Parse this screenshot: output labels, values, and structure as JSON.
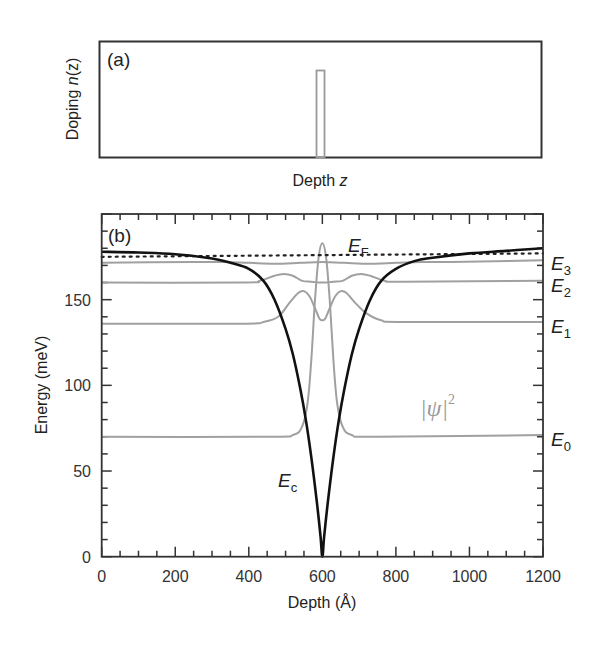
{
  "chart_data": [
    {
      "panel": "(a)",
      "type": "line",
      "title": "",
      "xlabel": "Depth z",
      "ylabel": "Doping n(z)",
      "grid": false,
      "description": "Delta-doping profile: narrow rectangular spike at center depth",
      "series": [
        {
          "name": "n(z)",
          "color": "#9a9a9a",
          "shape": "narrow rectangle at z = 600 Å (relative), width ≈ 25 Å"
        }
      ]
    },
    {
      "panel": "(b)",
      "type": "line",
      "title": "",
      "xlabel": "Depth (Å)",
      "ylabel": "Energy (meV)",
      "xlim": [
        0,
        1200
      ],
      "ylim": [
        0,
        200
      ],
      "xticks": [
        0,
        200,
        400,
        600,
        800,
        1000,
        1200
      ],
      "yticks": [
        0,
        50,
        100,
        150
      ],
      "grid": false,
      "annotations": [
        "(b)",
        "E_F",
        "E_c",
        "|ψ|^2",
        "E_0",
        "E_1",
        "E_2",
        "E_3"
      ],
      "series": [
        {
          "name": "E_c (conduction band edge)",
          "color": "#111111",
          "style": "solid",
          "x": [
            0,
            100,
            200,
            300,
            350,
            400,
            440,
            470,
            500,
            520,
            540,
            555,
            570,
            585,
            595,
            600,
            605,
            615,
            630,
            645,
            660,
            680,
            700,
            730,
            760,
            800,
            850,
            900,
            1000,
            1100,
            1200
          ],
          "y": [
            178,
            177.5,
            176.5,
            174,
            171.5,
            168,
            161,
            150,
            133,
            118,
            98,
            80,
            58,
            32,
            12,
            0,
            12,
            32,
            58,
            80,
            98,
            118,
            133,
            150,
            161,
            168,
            172.5,
            174.5,
            177,
            178.5,
            180
          ]
        },
        {
          "name": "E_F (Fermi level)",
          "color": "#222222",
          "style": "dotted",
          "x": [
            0,
            1200
          ],
          "y": [
            175,
            177
          ]
        },
        {
          "name": "E_0 + |ψ0|^2",
          "color": "#a0a0a0",
          "style": "solid",
          "x": [
            0,
            450,
            520,
            545,
            560,
            570,
            580,
            590,
            600,
            610,
            620,
            630,
            640,
            655,
            680,
            750,
            1200
          ],
          "y": [
            70,
            70,
            71,
            76,
            90,
            115,
            150,
            175,
            183,
            175,
            150,
            115,
            90,
            76,
            71,
            70,
            71
          ]
        },
        {
          "name": "E_1 + |ψ1|^2",
          "color": "#a0a0a0",
          "style": "solid",
          "x": [
            0,
            380,
            440,
            480,
            510,
            535,
            550,
            565,
            580,
            592,
            600,
            608,
            620,
            635,
            650,
            665,
            690,
            720,
            760,
            820,
            1200
          ],
          "y": [
            136,
            136,
            137,
            140,
            148,
            154,
            155,
            152,
            145,
            139,
            138,
            139,
            145,
            152,
            155,
            154,
            148,
            142,
            138,
            137,
            137
          ]
        },
        {
          "name": "E_2 + |ψ2|^2",
          "color": "#a0a0a0",
          "style": "solid",
          "x": [
            0,
            380,
            430,
            470,
            495,
            520,
            545,
            570,
            590,
            600,
            610,
            630,
            655,
            680,
            705,
            730,
            770,
            820,
            1200
          ],
          "y": [
            160,
            160,
            161,
            164,
            165,
            164,
            161,
            160.5,
            160,
            160,
            160,
            160.5,
            161,
            164,
            165,
            164,
            161,
            160.5,
            161
          ]
        },
        {
          "name": "E_3 + |ψ3|^2",
          "color": "#a0a0a0",
          "style": "solid",
          "x": [
            0,
            250,
            330,
            400,
            470,
            540,
            600,
            660,
            730,
            800,
            870,
            950,
            1200
          ],
          "y": [
            171.5,
            172,
            172,
            171.5,
            171,
            171.5,
            172,
            171.5,
            171,
            171.5,
            172,
            172,
            173
          ]
        }
      ],
      "level_labels": {
        "E3": 173,
        "E2": 161,
        "E1": 137,
        "E0": 70
      }
    }
  ],
  "panel_a": {
    "label": "(a)",
    "ylabel_prefix": "Doping ",
    "ylabel_var": "n",
    "ylabel_suffix": "(z)",
    "xlabel_prefix": "Depth ",
    "xlabel_var": "z"
  },
  "panel_b": {
    "label": "(b)",
    "xlabel": "Depth (Å)",
    "ylabel": "Energy (meV)",
    "xtick_labels": [
      "0",
      "200",
      "400",
      "600",
      "800",
      "1000",
      "1200"
    ],
    "ytick_labels": [
      "0",
      "50",
      "100",
      "150"
    ],
    "ef_label": {
      "main": "E",
      "sub": "F"
    },
    "ec_label": {
      "main": "E",
      "sub": "c"
    },
    "psi_label": {
      "main": "|ψ|",
      "sup": "2"
    },
    "levels": [
      {
        "main": "E",
        "sub": "3"
      },
      {
        "main": "E",
        "sub": "2"
      },
      {
        "main": "E",
        "sub": "1"
      },
      {
        "main": "E",
        "sub": "0"
      }
    ]
  }
}
